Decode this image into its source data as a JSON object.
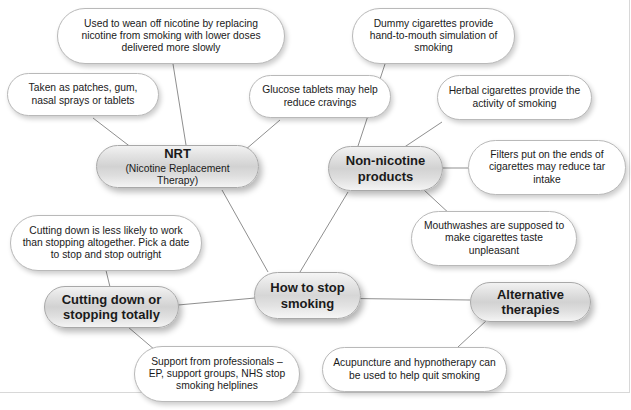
{
  "diagram": {
    "type": "mind-map",
    "title": "How to stop smoking",
    "center": {
      "label": "How to stop smoking"
    },
    "branches": [
      {
        "id": "nrt",
        "label": "NRT",
        "sublabel": "(Nicotine Replacement Therapy)",
        "leaves": [
          "Used to wean off nicotine by replacing nicotine from smoking with lower doses delivered more slowly",
          "Taken as patches, gum, nasal sprays or tablets",
          "Glucose tablets may help reduce cravings"
        ]
      },
      {
        "id": "non-nicotine-products",
        "label": "Non-nicotine products",
        "sublabel": "",
        "leaves": [
          "Dummy cigarettes provide hand-to-mouth simulation of smoking",
          "Herbal cigarettes provide the activity of smoking",
          "Filters put on the ends of cigarettes may reduce tar intake",
          "Mouthwashes are supposed to make cigarettes taste unpleasant"
        ]
      },
      {
        "id": "cutting-down-or-stopping-totally",
        "label": "Cutting down or stopping totally",
        "sublabel": "",
        "leaves": [
          "Cutting down is less likely to work than stopping altogether. Pick a date to stop and stop outright",
          "Support from professionals – EP, support groups, NHS stop smoking helplines"
        ]
      },
      {
        "id": "alternative-therapies",
        "label": "Alternative therapies",
        "sublabel": "",
        "leaves": [
          "Acupuncture and hypnotherapy can be used to help quit smoking"
        ]
      }
    ],
    "colors": {
      "leaf_fill": "#ffffff",
      "branch_fill": "#d9d9d9",
      "node_border": "#b9b9b9",
      "edge_line": "#8f8f8f",
      "text": "#1a1a1a"
    }
  }
}
